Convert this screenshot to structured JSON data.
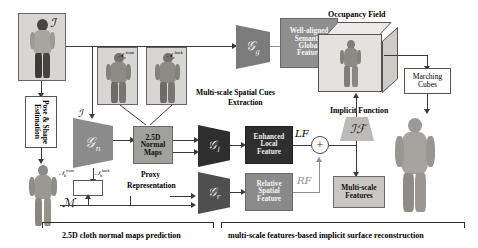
{
  "figure": {
    "stage_width": 478,
    "stage_height": 248
  },
  "colors": {
    "dark_block": "#3b3b3b",
    "mid_block": "#6f6f6f",
    "light_block": "#9a9a9a",
    "encoder_dark": "#2f2f2f",
    "encoder_mid": "#5e5e5e",
    "encoder_light": "#8b8b8b",
    "photo_bg": "#d8d6d2",
    "line": "#3a3a3a",
    "line_light": "#8e8e8e"
  },
  "inputs": {
    "input_image_label": "ℐ",
    "input_image_label2": "ℐ",
    "mesh_label": "ℳ"
  },
  "blocks": {
    "pose_shape_estimation": "Pose & Shape Estimation",
    "differentiable_renderer": "𝒟𝒡",
    "normal_maps": "2.5D\nNormal\nMaps",
    "normal_maps_lines": [
      "2.5D",
      "Normal",
      "Maps"
    ],
    "proxy_representation_lines": [
      "Proxy",
      "Representation"
    ],
    "global_feature_lines": [
      "Well-aligned",
      "Semantic",
      "Global",
      "Feature"
    ],
    "local_feature_lines": [
      "Enhanced",
      "Local",
      "Feature"
    ],
    "spatial_feature_lines": [
      "Relative",
      "Spatial",
      "Feature"
    ],
    "multiscale_features_lines": [
      "Multi-scale",
      "Features"
    ],
    "marching_cubes_lines": [
      "Marching",
      "Cubes"
    ],
    "multiscale_spatial_cues_lines": [
      "Multi-scale Spatial Cues",
      "Extraction"
    ],
    "occupancy_field": "Occupancy Field",
    "implicit_function_title": "Implicit Function"
  },
  "encoders": {
    "normal_net": "𝒢",
    "normal_net_sub": "n",
    "global_net": "𝒢",
    "global_net_sub": "g",
    "local_net": "𝒢",
    "local_net_sub": "l",
    "relative_net": "𝒢",
    "relative_net_sub": "r",
    "implicit_function": "ℐℱ"
  },
  "feature_tags": {
    "global_feature": "GF",
    "local_feature": "LF",
    "relative_feature": "RF",
    "sum_symbol": "+"
  },
  "normal_map_labels": {
    "cloth_front_base": "𝒩",
    "cloth_front_sub": "c",
    "cloth_front_sup": "front",
    "cloth_back_base": "𝒩",
    "cloth_back_sub": "c",
    "cloth_back_sup": "back",
    "body_front_base": "𝒩",
    "body_front_sub": "b",
    "body_front_sup": "front",
    "body_back_base": "𝒩",
    "body_back_sub": "b",
    "body_back_sup": "back"
  },
  "captions": {
    "left": "2.5D cloth normal maps prediction",
    "right": "multi-scale features-based implicit surface reconstruction"
  }
}
